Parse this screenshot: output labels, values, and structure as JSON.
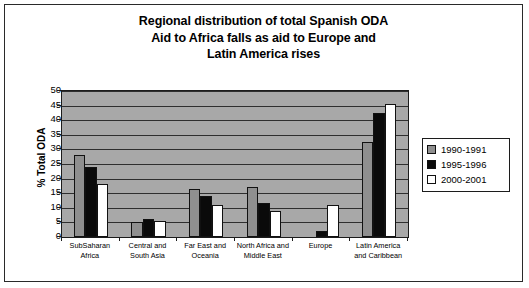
{
  "chart_data": {
    "type": "bar",
    "title": "Regional distribution of total Spanish ODA Aid to Africa falls as aid to Europe and Latin America rises",
    "title_lines": [
      "Regional distribution of total Spanish ODA",
      "Aid to Africa falls as aid to Europe and",
      "Latin America rises"
    ],
    "xlabel": "",
    "ylabel": "% Total ODA",
    "ylim": [
      0,
      50
    ],
    "ytick_step": 5,
    "yticks": [
      0,
      5,
      10,
      15,
      20,
      25,
      30,
      35,
      40,
      45,
      50
    ],
    "ytick_labels": [
      "0",
      "5",
      "10",
      "15",
      "20",
      "25",
      "30",
      "35",
      "40",
      "45",
      "50"
    ],
    "grid": true,
    "grid_orientation": "horizontal",
    "legend_position": "right",
    "categories": [
      "SubSaharan Africa",
      "Central and South Asia",
      "Far East and Oceania",
      "North Africa and Middle East",
      "Europe",
      "Latin America and Caribbean"
    ],
    "category_lines": [
      [
        "SubSaharan",
        "Africa"
      ],
      [
        "Central and",
        "South Asia"
      ],
      [
        "Far East and",
        "Oceania"
      ],
      [
        "North Africa and",
        "Middle East"
      ],
      [
        "Europe",
        ""
      ],
      [
        "Latin America",
        "and Caribbean"
      ]
    ],
    "series": [
      {
        "name": "1990-1991",
        "color": "#8f8f8f",
        "values": [
          28,
          5,
          16.5,
          17,
          0,
          32.5
        ]
      },
      {
        "name": "1995-1996",
        "color": "#0a0a0a",
        "values": [
          24,
          6,
          14,
          11.5,
          2,
          42.5
        ]
      },
      {
        "name": "2000-2001",
        "color": "#ffffff",
        "values": [
          18,
          5.5,
          11,
          9,
          11,
          45.5
        ]
      }
    ]
  },
  "legend": {
    "entries": [
      {
        "label": "1990-1991"
      },
      {
        "label": "1995-1996"
      },
      {
        "label": "2000-2001"
      }
    ]
  }
}
